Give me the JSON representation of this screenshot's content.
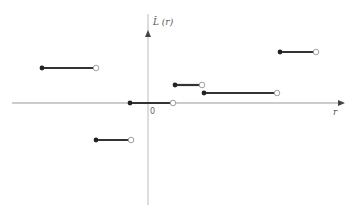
{
  "chart_data": {
    "type": "line",
    "title": "",
    "xlabel": "r",
    "ylabel": "L̂ (r)",
    "origin_label": "0",
    "grid": false,
    "legend": null,
    "segments": [
      {
        "x_start": -2.9,
        "x_end": -1.4,
        "y": 1.0
      },
      {
        "x_start": -0.5,
        "x_end": 0.6,
        "y": 0.0
      },
      {
        "x_start": 0.7,
        "x_end": 1.5,
        "y": 0.5
      },
      {
        "x_start": 1.5,
        "x_end": 3.5,
        "y": 0.3
      },
      {
        "x_start": 3.6,
        "x_end": 4.6,
        "y": 1.4
      },
      {
        "x_start": -1.5,
        "x_end": -0.5,
        "y": -1.0
      }
    ],
    "colors": {
      "axis": "#999999",
      "segment": "#333333"
    }
  },
  "pixels": {
    "axis": {
      "ox": 148,
      "oy": 103,
      "x_left": 12,
      "x_right": 345,
      "y_top": 10,
      "y_bottom": 205
    },
    "segments": [
      {
        "x1": 42,
        "x2": 96,
        "y": 68
      },
      {
        "x1": 130,
        "x2": 173,
        "y": 103
      },
      {
        "x1": 175,
        "x2": 202,
        "y": 85
      },
      {
        "x1": 204,
        "x2": 277,
        "y": 93
      },
      {
        "x1": 280,
        "x2": 316,
        "y": 52
      },
      {
        "x1": 96,
        "x2": 131,
        "y": 140
      }
    ]
  }
}
